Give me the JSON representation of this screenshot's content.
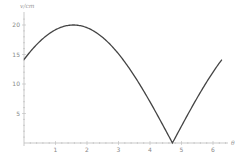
{
  "chart_data": {
    "type": "line",
    "title": "",
    "xlabel": "θ",
    "ylabel": "v/cm",
    "xlim": [
      0,
      6.6
    ],
    "ylim": [
      0,
      21
    ],
    "x_ticks": [
      1,
      2,
      3,
      4,
      5,
      6
    ],
    "y_ticks": [
      5,
      10,
      15,
      20
    ],
    "grid": false,
    "legend": null,
    "series": [
      {
        "name": "v(θ)",
        "color": "#444444",
        "x": [
          0,
          0.25,
          0.5,
          0.75,
          1.0,
          1.25,
          1.5,
          1.57,
          1.75,
          2.0,
          2.25,
          2.5,
          2.75,
          3.0,
          3.25,
          3.5,
          3.75,
          4.0,
          4.25,
          4.5,
          4.71,
          5.0,
          5.25,
          5.5,
          5.75,
          6.0,
          6.28
        ],
        "values": [
          14.14,
          15.87,
          17.35,
          18.55,
          19.44,
          19.97,
          20.0,
          20.0,
          19.92,
          19.44,
          18.55,
          17.35,
          15.87,
          14.14,
          12.19,
          10.05,
          7.75,
          5.36,
          2.9,
          0.43,
          0.0,
          2.9,
          5.32,
          7.72,
          10.03,
          12.19,
          14.14
        ]
      }
    ]
  },
  "axes": {
    "x_axis_label": "θ",
    "y_axis_label": "v/cm",
    "x_tick_labels": [
      "1",
      "2",
      "3",
      "4",
      "5",
      "6"
    ],
    "y_tick_labels": [
      "5",
      "10",
      "15",
      "20"
    ]
  }
}
